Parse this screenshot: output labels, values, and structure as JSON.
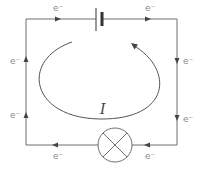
{
  "diagram": {
    "type": "circuit",
    "components": {
      "battery": "battery-cell",
      "lamp": "lamp"
    },
    "current_label": "I",
    "electron_label": "e⁻",
    "electron_labels": {
      "top_left": "e⁻",
      "top_right": "e⁻",
      "right_upper": "e⁻",
      "right_lower": "e⁻",
      "bottom_right": "e⁻",
      "bottom_left": "e⁻",
      "left_lower": "e⁻",
      "left_upper": "e⁻"
    },
    "electron_flow_direction": "clockwise",
    "conventional_current_direction": "counterclockwise",
    "colors": {
      "wire": "#6e6e6e",
      "label": "#8a8a8a",
      "current_arc": "#555555"
    }
  }
}
